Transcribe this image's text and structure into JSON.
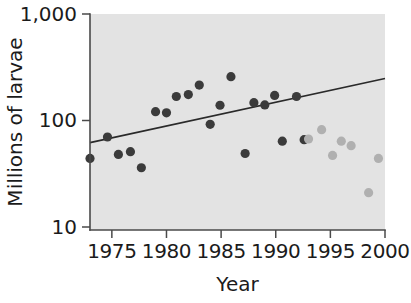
{
  "chart_data": {
    "type": "scatter",
    "title": "",
    "xlabel": "Year",
    "ylabel": "Millions of larvae",
    "xlim": [
      1973.0,
      2000.0
    ],
    "ylim": [
      10,
      1000
    ],
    "yscale": "log",
    "grid": false,
    "legend": "none",
    "x_ticks": [
      1975,
      1980,
      1985,
      1990,
      1995,
      2000
    ],
    "x_tick_labels": [
      "1975",
      "1980",
      "1985",
      "1990",
      "1995",
      "2000"
    ],
    "y_ticks": [
      10,
      100,
      1000
    ],
    "y_tick_labels": [
      "10",
      "100",
      "1,000"
    ],
    "plot_background_color": "#e3e3e3",
    "series": [
      {
        "name": "early-period-observations",
        "marker": "filled-circle",
        "color": "#3b3b3b",
        "points": [
          {
            "x": 1973.0,
            "y": 44
          },
          {
            "x": 1974.6,
            "y": 70
          },
          {
            "x": 1975.6,
            "y": 48
          },
          {
            "x": 1976.7,
            "y": 51
          },
          {
            "x": 1977.7,
            "y": 36
          },
          {
            "x": 1979.0,
            "y": 121
          },
          {
            "x": 1980.0,
            "y": 118
          },
          {
            "x": 1980.9,
            "y": 168
          },
          {
            "x": 1982.0,
            "y": 175
          },
          {
            "x": 1983.0,
            "y": 215
          },
          {
            "x": 1984.0,
            "y": 92
          },
          {
            "x": 1984.9,
            "y": 139
          },
          {
            "x": 1985.9,
            "y": 258
          },
          {
            "x": 1987.2,
            "y": 49
          },
          {
            "x": 1988.0,
            "y": 147
          },
          {
            "x": 1989.0,
            "y": 140
          },
          {
            "x": 1989.9,
            "y": 172
          },
          {
            "x": 1990.6,
            "y": 64
          },
          {
            "x": 1991.9,
            "y": 168
          },
          {
            "x": 1992.6,
            "y": 66
          }
        ]
      },
      {
        "name": "late-period-observations",
        "marker": "filled-circle",
        "color": "#b0b0b0",
        "points": [
          {
            "x": 1993.0,
            "y": 67
          },
          {
            "x": 1994.2,
            "y": 82
          },
          {
            "x": 1995.2,
            "y": 47
          },
          {
            "x": 1996.0,
            "y": 64
          },
          {
            "x": 1996.9,
            "y": 58
          },
          {
            "x": 1998.5,
            "y": 21
          },
          {
            "x": 1999.4,
            "y": 44
          }
        ]
      }
    ],
    "trend_line": {
      "name": "fitted-regression-line",
      "color": "#2a2a2a",
      "x_start": 1973.0,
      "y_start": 62,
      "x_end": 2000.0,
      "y_end": 248
    }
  },
  "figure": {
    "x_axis_title": "Year",
    "y_axis_title": "Millions of larvae"
  }
}
